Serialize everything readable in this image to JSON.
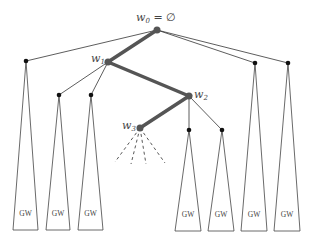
{
  "diagram": {
    "type": "search-tree",
    "root_label": {
      "base": "w",
      "sub": "0",
      "suffix": " = ∅"
    },
    "path_labels": [
      {
        "base": "w",
        "sub": "1"
      },
      {
        "base": "w",
        "sub": "2"
      },
      {
        "base": "w",
        "sub": "3"
      }
    ],
    "subtree_label": "GW",
    "subtrees": [
      "GW",
      "GW",
      "GW",
      "GW",
      "GW",
      "GW",
      "GW"
    ],
    "colors": {
      "path": "#555555",
      "edge": "#333333"
    }
  }
}
